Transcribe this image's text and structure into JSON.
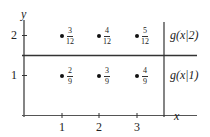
{
  "diagram": {
    "axes": {
      "y_label": "y",
      "x_label": "x",
      "x_ticks": [
        "1",
        "2",
        "3"
      ],
      "y_ticks": [
        "1",
        "2"
      ]
    },
    "rows": [
      {
        "y": "2",
        "label": "g(x|2)",
        "points": [
          {
            "x": "1",
            "num": "3",
            "den": "12"
          },
          {
            "x": "2",
            "num": "4",
            "den": "12"
          },
          {
            "x": "3",
            "num": "5",
            "den": "12"
          }
        ]
      },
      {
        "y": "1",
        "label": "g(x|1)",
        "points": [
          {
            "x": "1",
            "num": "2",
            "den": "9"
          },
          {
            "x": "2",
            "num": "3",
            "den": "9"
          },
          {
            "x": "3",
            "num": "4",
            "den": "9"
          }
        ]
      }
    ],
    "colors": {
      "line": "#333333",
      "text": "#222222"
    }
  }
}
